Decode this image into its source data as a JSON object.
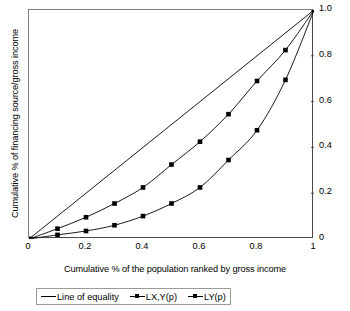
{
  "chart_data": {
    "type": "line",
    "title": "",
    "xlabel": "Cumulative % of the population ranked by gross income",
    "ylabel": "Cumulative % of financing source/gross income",
    "xlim": [
      0,
      1
    ],
    "ylim": [
      0,
      1
    ],
    "grid": false,
    "y_axis_position": "right",
    "legend_position": "below-axes",
    "x_ticks": [
      {
        "value": 0,
        "label": "0"
      },
      {
        "value": 0.2,
        "label": "0.2"
      },
      {
        "value": 0.4,
        "label": "0.4"
      },
      {
        "value": 0.6,
        "label": "0.6"
      },
      {
        "value": 0.8,
        "label": "0.8"
      },
      {
        "value": 1,
        "label": "1"
      }
    ],
    "y_ticks": [
      {
        "value": 1,
        "label": "1.0"
      },
      {
        "value": 0.8,
        "label": "0.8"
      },
      {
        "value": 0.6,
        "label": "0.6"
      },
      {
        "value": 0.4,
        "label": "0.4"
      },
      {
        "value": 0.2,
        "label": "0.2"
      },
      {
        "value": 0,
        "label": "0"
      }
    ],
    "x": [
      0,
      0.1,
      0.2,
      0.3,
      0.4,
      0.5,
      0.6,
      0.7,
      0.8,
      0.9,
      1
    ],
    "series": [
      {
        "name": "Line of equality",
        "marker": "none",
        "color": "#000000",
        "values": [
          0,
          0.1,
          0.2,
          0.3,
          0.4,
          0.5,
          0.6,
          0.7,
          0.8,
          0.9,
          1
        ]
      },
      {
        "name": "LX,Y(p)",
        "marker": "square",
        "color": "#000000",
        "values": [
          0,
          0.045,
          0.095,
          0.155,
          0.225,
          0.325,
          0.425,
          0.545,
          0.69,
          0.825,
          1
        ]
      },
      {
        "name": "LY(p)",
        "marker": "square",
        "color": "#000000",
        "values": [
          0,
          0.018,
          0.035,
          0.06,
          0.1,
          0.155,
          0.225,
          0.345,
          0.475,
          0.695,
          1
        ]
      }
    ]
  }
}
